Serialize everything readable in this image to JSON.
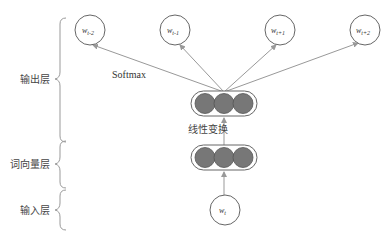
{
  "diagram": {
    "type": "skip-gram",
    "layers": [
      {
        "name": "output-layer",
        "label": "输出层"
      },
      {
        "name": "word-vector-layer",
        "label": "词向量层"
      },
      {
        "name": "input-layer",
        "label": "输入层"
      }
    ],
    "output_nodes": [
      {
        "label": "w",
        "sub": "t-2"
      },
      {
        "label": "w",
        "sub": "t-1"
      },
      {
        "label": "w",
        "sub": "t+1"
      },
      {
        "label": "w",
        "sub": "t+2"
      }
    ],
    "input_node": {
      "label": "w",
      "sub": "t"
    },
    "softmax_label": "Softmax",
    "linear_transform_label": "线性变换",
    "colors": {
      "line": "#999999",
      "node_fill": "#777777",
      "circle_stroke": "#666666"
    }
  }
}
